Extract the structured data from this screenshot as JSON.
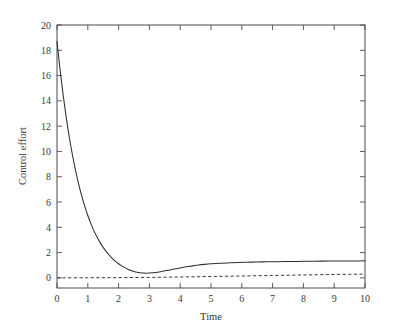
{
  "chart_data": {
    "type": "line",
    "title": "",
    "xlabel": "Time",
    "ylabel": "Control effort",
    "xlim": [
      0,
      10
    ],
    "ylim": [
      -0.8,
      20
    ],
    "grid": false,
    "legend": "none",
    "background": "#ffffff",
    "line_color": "#2e2e2e",
    "dashed_color": "#3a3a3a",
    "xticks": [
      0,
      1,
      2,
      3,
      4,
      5,
      6,
      7,
      8,
      9,
      10
    ],
    "xtick_labels": [
      "0",
      "1",
      "2",
      "3",
      "4",
      "5",
      "6",
      "7",
      "8",
      "9",
      "10"
    ],
    "yticks": [
      0,
      2,
      4,
      6,
      8,
      10,
      12,
      14,
      16,
      18,
      20
    ],
    "ytick_labels": [
      "0",
      "2",
      "4",
      "6",
      "8",
      "10",
      "12",
      "14",
      "16",
      "18",
      "20"
    ],
    "series": [
      {
        "name": "control-effort-solid",
        "style": "solid",
        "x": [
          0.0,
          0.1,
          0.2,
          0.3,
          0.4,
          0.5,
          0.6,
          0.7,
          0.8,
          0.9,
          1.0,
          1.1,
          1.2,
          1.3,
          1.4,
          1.5,
          1.6,
          1.7,
          1.8,
          1.9,
          2.0,
          2.1,
          2.2,
          2.3,
          2.4,
          2.5,
          2.6,
          2.7,
          2.8,
          2.9,
          3.0,
          3.2,
          3.4,
          3.6,
          3.8,
          4.0,
          4.2,
          4.4,
          4.6,
          4.8,
          5.0,
          5.3,
          5.6,
          5.9,
          6.2,
          6.5,
          6.8,
          7.1,
          7.4,
          7.7,
          8.0,
          8.4,
          8.8,
          9.2,
          9.6,
          10.0
        ],
        "y": [
          18.7,
          16.45,
          14.45,
          12.68,
          11.12,
          9.74,
          8.52,
          7.45,
          6.5,
          5.67,
          4.93,
          4.29,
          3.72,
          3.23,
          2.79,
          2.41,
          2.08,
          1.79,
          1.53,
          1.31,
          1.12,
          0.95,
          0.81,
          0.69,
          0.59,
          0.51,
          0.45,
          0.41,
          0.38,
          0.37,
          0.38,
          0.43,
          0.51,
          0.6,
          0.7,
          0.79,
          0.88,
          0.95,
          1.02,
          1.07,
          1.11,
          1.16,
          1.19,
          1.22,
          1.24,
          1.26,
          1.27,
          1.28,
          1.29,
          1.3,
          1.31,
          1.32,
          1.33,
          1.34,
          1.34,
          1.35
        ]
      },
      {
        "name": "reference-dashed",
        "style": "dashed",
        "x": [
          0.0,
          1.0,
          2.0,
          3.0,
          4.0,
          5.0,
          6.0,
          7.0,
          8.0,
          9.0,
          10.0
        ],
        "y": [
          0.0,
          0.01,
          0.02,
          0.04,
          0.07,
          0.11,
          0.15,
          0.19,
          0.23,
          0.27,
          0.3
        ]
      }
    ]
  }
}
